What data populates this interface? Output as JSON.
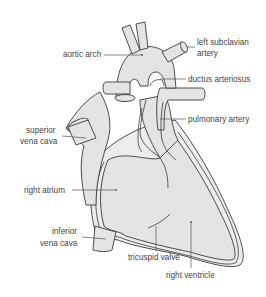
{
  "diagram": {
    "colors": {
      "tissue_fill": "#e4e4e4",
      "outline": "#3a3a3a",
      "label_text": "#444444",
      "background": "#ffffff"
    },
    "labels": {
      "aortic_arch": "aortic arch",
      "left_subclavian_line1": "left subclavian",
      "left_subclavian_line2": "artery",
      "ductus_arteriosus": "ductus arteriosus",
      "pulmonary_artery": "pulmonary artery",
      "superior_vena_cava_line1": "superior",
      "superior_vena_cava_line2": "vena cava",
      "right_atrium": "right atrium",
      "inferior_vena_cava_line1": "inferior",
      "inferior_vena_cava_line2": "vena cava",
      "tricuspid_valve": "tricuspid valve",
      "right_ventricle": "right ventricle"
    }
  }
}
